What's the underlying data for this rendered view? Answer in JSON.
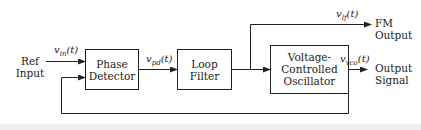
{
  "diagram": {
    "type": "block-diagram",
    "inputs": {
      "ref_input_line1": "Ref",
      "ref_input_line2": "Input"
    },
    "blocks": [
      {
        "id": "phase_detector",
        "line1": "Phase",
        "line2": "Detector",
        "line3": ""
      },
      {
        "id": "loop_filter",
        "line1": "Loop",
        "line2": "Filter",
        "line3": ""
      },
      {
        "id": "vco",
        "line1": "Voltage-",
        "line2": "Controlled",
        "line3": "Oscillator"
      }
    ],
    "signals": {
      "vin": {
        "main": "v",
        "sub": "in",
        "arg": "(t)"
      },
      "vpd": {
        "main": "v",
        "sub": "pd",
        "arg": "(t)"
      },
      "vlf": {
        "main": "v",
        "sub": "lf",
        "arg": "(t)"
      },
      "vvco": {
        "main": "v",
        "sub": "vco",
        "arg": "(t)"
      }
    },
    "outputs": {
      "fm_line1": "FM",
      "fm_line2": "Output",
      "out_line1": "Output",
      "out_line2": "Signal"
    },
    "colors": {
      "line": "#222222",
      "box_fill": "#ffffff"
    }
  }
}
